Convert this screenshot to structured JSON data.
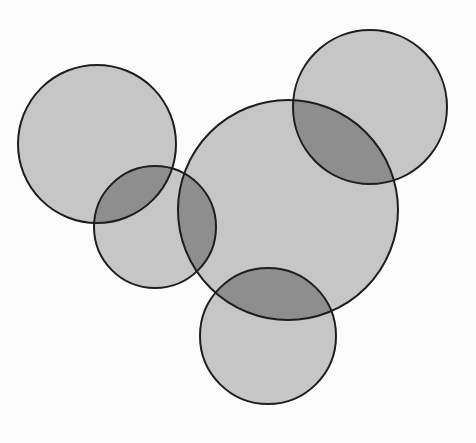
{
  "diagram": {
    "type": "overlapping-circles",
    "background": "#fcfcfc",
    "fill_color": "#c6c6c6",
    "overlap_color": "#8e8e8e",
    "stroke_color": "#1e1e1e",
    "stroke_width": 2,
    "circles": [
      {
        "id": "top-left",
        "cx": 97,
        "cy": 144,
        "r": 79
      },
      {
        "id": "top-right",
        "cx": 370,
        "cy": 107,
        "r": 77
      },
      {
        "id": "center-large",
        "cx": 288,
        "cy": 210,
        "r": 110
      },
      {
        "id": "middle-left",
        "cx": 155,
        "cy": 227,
        "r": 61
      },
      {
        "id": "bottom",
        "cx": 268,
        "cy": 336,
        "r": 68
      }
    ]
  }
}
